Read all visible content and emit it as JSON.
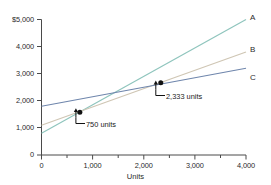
{
  "chart_data": {
    "type": "line",
    "title": "",
    "xlabel": "Units",
    "ylabel": "",
    "xlim": [
      0,
      4000
    ],
    "ylim": [
      0,
      5000
    ],
    "grid": false,
    "legend_position": "right-end-of-line",
    "x_ticks": [
      0,
      1000,
      2000,
      3000,
      4000
    ],
    "x_tick_labels": [
      "0",
      "1,000",
      "2,000",
      "3,000",
      "4,000"
    ],
    "x_minor_ticks": [
      500,
      1500,
      2500,
      3500
    ],
    "y_ticks": [
      0,
      1000,
      2000,
      3000,
      4000,
      5000
    ],
    "y_tick_labels": [
      "0",
      "1,000",
      "2,000",
      "3,000",
      "4,000",
      "$5,000"
    ],
    "series": [
      {
        "name": "A",
        "color": "#8fc5bd",
        "x": [
          0,
          4000
        ],
        "values": [
          800,
          5000
        ]
      },
      {
        "name": "B",
        "color": "#cfc6b4",
        "x": [
          0,
          4000
        ],
        "values": [
          1100,
          3800
        ]
      },
      {
        "name": "C",
        "color": "#6f86ac",
        "x": [
          0,
          4000
        ],
        "values": [
          1800,
          3200
        ]
      }
    ],
    "annotations": [
      {
        "label": "750 units",
        "x": 750,
        "y": 1580,
        "marker": "filled-circle"
      },
      {
        "label": "2,333 units",
        "x": 2333,
        "y": 2670,
        "marker": "filled-circle"
      }
    ]
  },
  "axes": {
    "x_title": "Units",
    "axis_color": "#4a4a4a"
  },
  "series_labels": {
    "a": "A",
    "b": "B",
    "c": "C"
  },
  "y_labels": {
    "t5000": "$5,000",
    "t4000": "4,000",
    "t3000": "3,000",
    "t2000": "2,000",
    "t1000": "1,000",
    "t0": "0"
  },
  "x_labels": {
    "t0": "0",
    "t1000": "1,000",
    "t2000": "2,000",
    "t3000": "3,000",
    "t4000": "4,000"
  },
  "annotation_labels": {
    "first": "750 units",
    "second": "2,333 units"
  }
}
